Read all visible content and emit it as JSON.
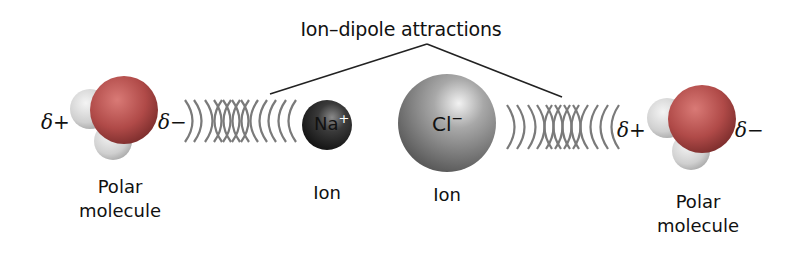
{
  "title": "Ion–dipole attractions",
  "left_molecule": {
    "delta_left": "δ+",
    "delta_right": "δ−",
    "label_line1": "Polar",
    "label_line2": "molecule"
  },
  "cation": {
    "symbol": "Na",
    "charge": "+",
    "label": "Ion"
  },
  "anion": {
    "symbol": "Cl",
    "charge": "−",
    "label": "Ion"
  },
  "right_molecule": {
    "delta_left": "δ+",
    "delta_right": "δ−",
    "label_line1": "Polar",
    "label_line2": "molecule"
  },
  "colors": {
    "oxygen": "#b04a48",
    "hydrogen": "#d8d8d8",
    "cation": "#2a2a2a",
    "anion": "#9a9a9a",
    "waves": "#7a7a7a",
    "leader_lines": "#222222"
  }
}
